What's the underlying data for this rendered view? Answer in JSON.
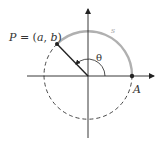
{
  "diagram": {
    "center": {
      "x": 88,
      "y": 76
    },
    "radius": 44,
    "theta_deg": 134,
    "colors": {
      "axis": "#222222",
      "arc": "#b0b0b0",
      "dashed": "#333333",
      "label": "#333333",
      "arc_label": "#aaaaaa"
    },
    "labels": {
      "point_p": "P = (a, b)",
      "point_p_name": "P",
      "point_p_eq": " = (",
      "point_p_a": "a",
      "point_p_comma": ", ",
      "point_p_b": "b",
      "point_p_close": ")",
      "point_a": "A",
      "arc_length": "s",
      "angle": "θ"
    }
  }
}
